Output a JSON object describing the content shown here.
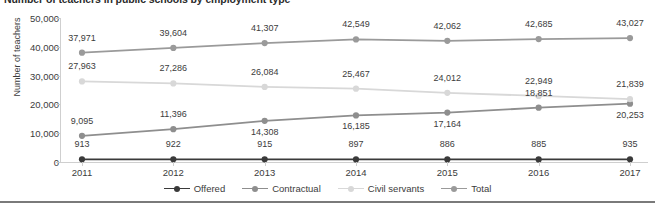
{
  "chart_data": {
    "type": "line",
    "title": "Number of teachers in public schools by employment type",
    "xlabel": "",
    "ylabel": "Number of teachers",
    "categories": [
      "2011",
      "2012",
      "2013",
      "2014",
      "2015",
      "2016",
      "2017"
    ],
    "ylim": [
      0,
      50000
    ],
    "yticks": [
      "0",
      "10,000",
      "20,000",
      "30,000",
      "40,000",
      "50,000"
    ],
    "ytick_values": [
      0,
      10000,
      20000,
      30000,
      40000,
      50000
    ],
    "grid": false,
    "legend_position": "bottom",
    "series": [
      {
        "name": "Offered",
        "color": "#3a3a3a",
        "values": [
          913,
          922,
          915,
          897,
          886,
          885,
          935
        ],
        "labels": [
          "913",
          "922",
          "915",
          "897",
          "886",
          "885",
          "935"
        ]
      },
      {
        "name": "Contractual",
        "color": "#8e8e8e",
        "values": [
          9095,
          11396,
          14308,
          16185,
          17164,
          18851,
          20253
        ],
        "labels": [
          "9,095",
          "11,396",
          "14,308",
          "16,185",
          "17,164",
          "18,851",
          "20,253"
        ]
      },
      {
        "name": "Civil servants",
        "color": "#d8d8d8",
        "values": [
          27963,
          27286,
          26084,
          25467,
          24012,
          22949,
          21839
        ],
        "labels": [
          "27,963",
          "27,286",
          "26,084",
          "25,467",
          "24,012",
          "22,949",
          "21,839"
        ]
      },
      {
        "name": "Total",
        "color": "#9a9a9a",
        "values": [
          37971,
          39604,
          41307,
          42549,
          42062,
          42685,
          43027
        ],
        "labels": [
          "37,971",
          "39,604",
          "41,307",
          "42,549",
          "42,062",
          "42,685",
          "43,027"
        ]
      }
    ],
    "label_offsets": {
      "Offered": [
        -10,
        -10,
        -10,
        -10,
        -10,
        -10,
        -10
      ],
      "Contractual": [
        -10,
        -10,
        16,
        16,
        16,
        -10,
        16
      ],
      "Civil servants": [
        -10,
        -10,
        -10,
        -10,
        -10,
        -10,
        -10
      ],
      "Total": [
        -10,
        -10,
        -10,
        -10,
        -10,
        -10,
        -10
      ]
    }
  }
}
